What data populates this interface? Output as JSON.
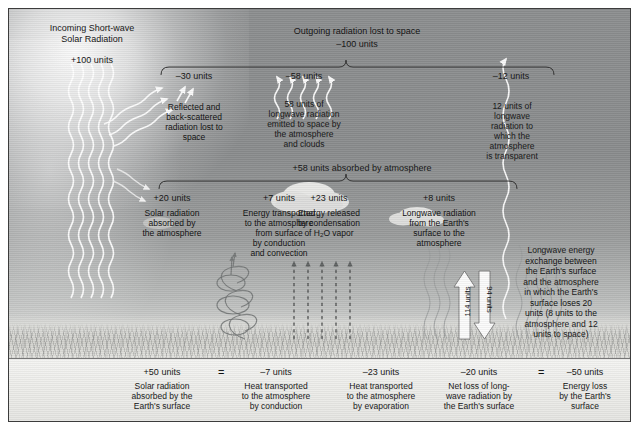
{
  "figure": {
    "title_solar": {
      "line1": "Incoming Short-wave",
      "line2": "Solar Radiation",
      "value": "+100 units"
    },
    "outgoing_header": {
      "label": "Outgoing radiation lost to space",
      "value": "–100 units"
    },
    "outgoing_items": [
      {
        "value": "–30 units",
        "desc_lines": [
          "Reflected and",
          "back-scattered",
          "radiation lost to",
          "space"
        ]
      },
      {
        "value": "–58 units",
        "desc_lines": [
          "58 units of",
          "longwave radiation",
          "emitted to space by",
          "the atmosphere",
          "and clouds"
        ]
      },
      {
        "value": "–12 units",
        "desc_lines": [
          "12 units of",
          "longwave",
          "radiation to",
          "which the",
          "atmosphere",
          "is transparent"
        ]
      }
    ],
    "absorbed_header": {
      "label": "+58 units absorbed by atmosphere"
    },
    "absorbed_items": [
      {
        "value": "+20 units",
        "desc_lines": [
          "Solar radiation",
          "absorbed by",
          "the atmosphere"
        ]
      },
      {
        "value": "+7 units",
        "desc_lines": [
          "Energy transported",
          "to the atmosphere",
          "from surface",
          "by conduction",
          "and convection"
        ]
      },
      {
        "value": "+23 units",
        "desc_lines": [
          "Energy released",
          "by condensation",
          "of H<sub>2</sub>O vapor"
        ],
        "desc_has_html": true
      },
      {
        "value": "+8 units",
        "desc_lines": [
          "Longwave radiation",
          "from the Earth's",
          "surface to the",
          "atmosphere"
        ]
      }
    ],
    "exchange_note": {
      "lines": [
        "Longwave energy",
        "exchange between",
        "the Earth's surface",
        "and the atmosphere",
        "in which the Earth's",
        "surface loses 20",
        "units (8 units to the",
        "atmosphere and 12",
        "units to space)"
      ]
    },
    "exchange_arrows": [
      {
        "label": "114 units",
        "direction": "up"
      },
      {
        "label": "94 units",
        "direction": "down"
      }
    ],
    "surface_budget": [
      {
        "value": "+50 units",
        "desc_lines": [
          "Solar radiation",
          "absorbed by the",
          "Earth's surface"
        ],
        "operator_after": "="
      },
      {
        "value": "–7 units",
        "desc_lines": [
          "Heat transported",
          "to the atmosphere",
          "by conduction"
        ],
        "operator_after": ""
      },
      {
        "value": "–23 units",
        "desc_lines": [
          "Heat transported",
          "to the atmosphere",
          "by evaporation"
        ],
        "operator_after": ""
      },
      {
        "value": "–20 units",
        "desc_lines": [
          "Net loss of long-",
          "wave radiation by",
          "the Earth's surface"
        ],
        "operator_after": "="
      },
      {
        "value": "–50 units",
        "desc_lines": [
          "Energy loss",
          "by the Earth's",
          "surface"
        ],
        "operator_after": ""
      }
    ],
    "colors": {
      "sky_top": "#8c8e8f",
      "sky_bottom": "#f2f2ef",
      "text": "#111111",
      "brace": "#2f2f2f",
      "ray_white": "#ffffff",
      "border": "#3c3c3c"
    }
  }
}
